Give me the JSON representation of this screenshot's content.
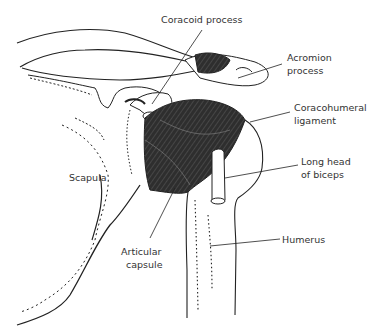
{
  "diagram": {
    "labels": {
      "coracoid_process": "Coracoid process",
      "acromion_line1": "Acromion",
      "acromion_line2": "process",
      "coracohumeral_line1": "Coracohumeral",
      "coracohumeral_line2": "ligament",
      "long_head_line1": "Long head",
      "long_head_line2": "of biceps",
      "scapula": "Scapula",
      "articular_line1": "Articular",
      "articular_line2": "capsule",
      "humerus": "Humerus"
    },
    "colors": {
      "line": "#222222",
      "muscle_fill": "#3a3a3a",
      "background": "#ffffff"
    }
  }
}
